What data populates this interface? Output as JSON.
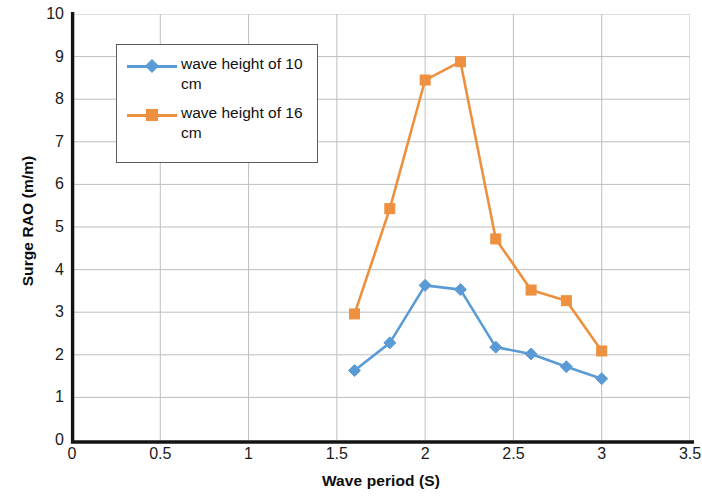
{
  "chart_data": {
    "type": "line",
    "title": "",
    "xlabel": "Wave period (S)",
    "ylabel": "Surge RAO (m/m)",
    "xlim": [
      0,
      3.5
    ],
    "ylim": [
      0,
      10
    ],
    "xticks": [
      "0",
      "0.5",
      "1",
      "1.5",
      "2",
      "2.5",
      "3",
      "3.5"
    ],
    "xtick_values": [
      0,
      0.5,
      1,
      1.5,
      2,
      2.5,
      3,
      3.5
    ],
    "yticks": [
      "0",
      "1",
      "2",
      "3",
      "4",
      "5",
      "6",
      "7",
      "8",
      "9",
      "10"
    ],
    "ytick_values": [
      0,
      1,
      2,
      3,
      4,
      5,
      6,
      7,
      8,
      9,
      10
    ],
    "grid": true,
    "grid_color": "#BFBFBF",
    "legend_position": "upper-left-inside",
    "x": [
      1.6,
      1.8,
      2.0,
      2.2,
      2.4,
      2.6,
      2.8,
      3.0
    ],
    "series": [
      {
        "name": "wave height of 10 cm",
        "color": "#5B9BD5",
        "marker": "diamond",
        "values": [
          1.63,
          2.28,
          3.63,
          3.53,
          2.18,
          2.02,
          1.72,
          1.44
        ]
      },
      {
        "name": "wave height of 16 cm",
        "color": "#ED9140",
        "marker": "square",
        "values": [
          2.96,
          5.43,
          8.45,
          8.88,
          4.72,
          3.52,
          3.27,
          2.09
        ]
      }
    ]
  },
  "legend": {
    "entries": [
      {
        "label": "wave height of 10 cm"
      },
      {
        "label": "wave height of 16 cm"
      }
    ]
  },
  "axes": {
    "y_title": "Surge RAO (m/m)",
    "x_title": "Wave period (S)"
  }
}
